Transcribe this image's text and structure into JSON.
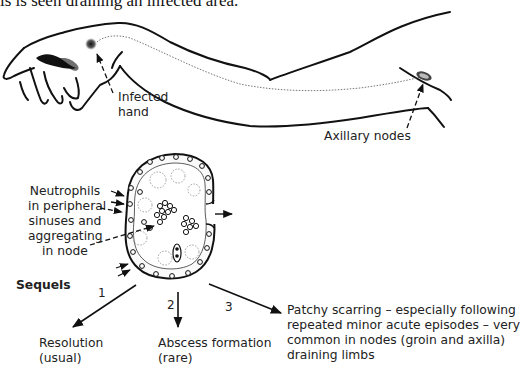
{
  "caption": {
    "top_text": "is is seen draining an infected area."
  },
  "arm_illustration": {
    "labels": {
      "infected_hand": [
        "Infected",
        "hand"
      ],
      "axillary_nodes": "Axillary nodes"
    }
  },
  "node_illustration": {
    "labels": {
      "neutrophils": [
        "Neutrophils",
        "in peripheral",
        "sinuses and",
        "aggregating",
        "in node"
      ]
    }
  },
  "sequels": {
    "heading": "Sequels",
    "items": [
      {
        "number": "1",
        "lines": [
          "Resolution",
          "(usual)"
        ]
      },
      {
        "number": "2",
        "lines": [
          "Abscess formation",
          "(rare)"
        ]
      },
      {
        "number": "3",
        "lines": [
          "Patchy scarring – especially following",
          "repeated minor acute episodes – very",
          "common in nodes (groin and axilla)",
          "draining limbs"
        ]
      }
    ]
  },
  "colors": {
    "ink": "#111111",
    "text": "#222222",
    "background": "#ffffff"
  }
}
